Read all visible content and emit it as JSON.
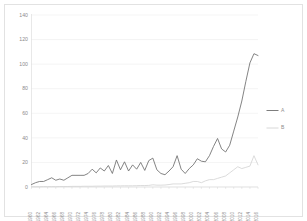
{
  "chart_data": {
    "type": "line",
    "title": "",
    "xlabel": "",
    "ylabel": "",
    "ylim": [
      0,
      140
    ],
    "ytick_step": 20,
    "grid": true,
    "legend_position": "right",
    "yticks": [
      "0",
      "20",
      "40",
      "60",
      "80",
      "100",
      "120",
      "140"
    ],
    "categories": [
      "1960",
      "1961",
      "1962",
      "1963",
      "1964",
      "1965",
      "1966",
      "1967",
      "1968",
      "1969",
      "1970",
      "1971",
      "1972",
      "1973",
      "1974",
      "1975",
      "1976",
      "1977",
      "1978",
      "1979",
      "1980",
      "1981",
      "1982",
      "1983",
      "1984",
      "1985",
      "1986",
      "1987",
      "1988",
      "1989",
      "1990",
      "1991",
      "1992",
      "1993",
      "1994",
      "1995",
      "1996",
      "1997",
      "1998",
      "1999",
      "2000",
      "2001",
      "2002",
      "2003",
      "2004",
      "2005",
      "2006",
      "2007",
      "2008",
      "2009",
      "2010",
      "2011",
      "2012",
      "2013",
      "2014",
      "2015",
      "2016"
    ],
    "xtick_labels": [
      "1960",
      "1962",
      "1964",
      "1966",
      "1968",
      "1970",
      "1972",
      "1974",
      "1976",
      "1978",
      "1980",
      "1982",
      "1984",
      "1986",
      "1988",
      "1990",
      "1992",
      "1994",
      "1996",
      "1998",
      "2000",
      "2002",
      "2004",
      "2006",
      "2008",
      "2010",
      "2012",
      "2014",
      "2016"
    ],
    "series": [
      {
        "name": "A",
        "color": "#6e6e6e",
        "values": [
          2.0,
          3.5,
          4.5,
          4.5,
          6.0,
          7.5,
          5.5,
          6.5,
          5.5,
          7.5,
          9.5,
          9.5,
          9.5,
          9.5,
          11.0,
          14.5,
          11.5,
          15.5,
          13.0,
          17.5,
          11.0,
          22.0,
          14.0,
          20.5,
          13.0,
          18.0,
          14.5,
          20.0,
          13.5,
          21.5,
          23.5,
          14.0,
          11.0,
          10.0,
          13.0,
          16.5,
          25.5,
          14.5,
          11.0,
          15.0,
          18.0,
          23.0,
          21.0,
          20.5,
          25.5,
          33.0,
          39.5,
          31.0,
          28.5,
          34.0,
          45.5,
          57.0,
          70.0,
          86.0,
          101.0,
          108.5,
          107.0
        ]
      },
      {
        "name": "B",
        "color": "#d4d4d4",
        "values": [
          0.2,
          0.2,
          0.2,
          0.3,
          0.3,
          0.3,
          0.3,
          0.4,
          0.4,
          0.4,
          0.5,
          0.5,
          0.5,
          0.6,
          0.6,
          0.6,
          0.7,
          0.7,
          0.8,
          0.8,
          0.8,
          0.9,
          0.9,
          1.0,
          1.0,
          1.0,
          1.1,
          1.2,
          1.2,
          1.3,
          1.8,
          1.5,
          1.5,
          1.6,
          2.0,
          2.5,
          2.5,
          2.5,
          3.0,
          3.5,
          4.5,
          4.5,
          3.5,
          5.0,
          6.0,
          6.0,
          7.0,
          8.0,
          9.0,
          11.5,
          14.0,
          16.5,
          15.0,
          16.0,
          17.0,
          25.5,
          18.0
        ]
      }
    ]
  },
  "legend": {
    "items": [
      {
        "label": "A"
      },
      {
        "label": "B"
      }
    ]
  }
}
